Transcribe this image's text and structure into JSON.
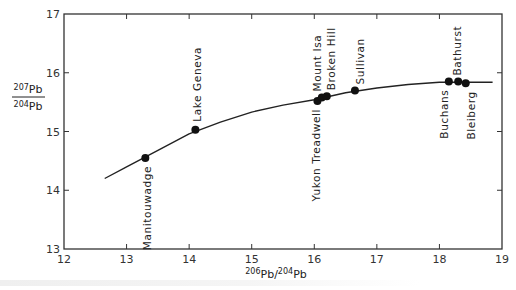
{
  "chart_data": {
    "type": "scatter",
    "title": "",
    "xlabel": "206Pb/204Pb",
    "ylabel": "207Pb/204Pb",
    "xlim": [
      12,
      19
    ],
    "ylim": [
      13,
      17
    ],
    "xticks": [
      12,
      13,
      14,
      15,
      16,
      17,
      18,
      19
    ],
    "yticks": [
      13,
      14,
      15,
      16,
      17
    ],
    "grid": false,
    "legend": null,
    "points": [
      {
        "name": "Manitouwadge",
        "x": 13.3,
        "y": 14.55,
        "label_side": "below"
      },
      {
        "name": "Lake Geneva",
        "x": 14.1,
        "y": 15.03,
        "label_side": "above"
      },
      {
        "name": "Yukon Treadwell",
        "x": 16.05,
        "y": 15.52,
        "label_side": "below"
      },
      {
        "name": "Mount Isa",
        "x": 16.12,
        "y": 15.58,
        "label_side": "above"
      },
      {
        "name": "Broken Hill",
        "x": 16.2,
        "y": 15.6,
        "label_side": "above"
      },
      {
        "name": "Sullivan",
        "x": 16.65,
        "y": 15.7,
        "label_side": "above"
      },
      {
        "name": "Buchans",
        "x": 18.15,
        "y": 15.85,
        "label_side": "below"
      },
      {
        "name": "Bathurst",
        "x": 18.3,
        "y": 15.85,
        "label_side": "above"
      },
      {
        "name": "Bleiberg",
        "x": 18.42,
        "y": 15.82,
        "label_side": "below"
      }
    ],
    "curve": {
      "description": "Single-stage lead growth curve",
      "x": [
        12.65,
        13.0,
        13.5,
        14.0,
        14.5,
        15.0,
        15.5,
        16.0,
        16.5,
        17.0,
        17.5,
        18.0,
        18.5,
        18.85
      ],
      "y": [
        14.2,
        14.4,
        14.68,
        14.96,
        15.16,
        15.33,
        15.45,
        15.54,
        15.66,
        15.74,
        15.8,
        15.84,
        15.84,
        15.84
      ]
    }
  },
  "axes": {
    "x_title_parts": {
      "sup1": "206",
      "base1": "Pb/",
      "sup2": "204",
      "base2": "Pb"
    },
    "y_title_parts": {
      "num_sup": "207",
      "num_base": "Pb",
      "den_sup": "204",
      "den_base": "Pb"
    }
  }
}
